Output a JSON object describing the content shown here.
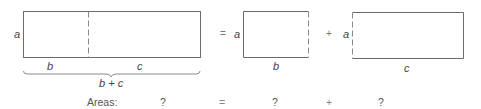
{
  "diagram": {
    "whole": {
      "height_label": "a",
      "width_labels": [
        "b",
        "c"
      ],
      "total_width_label": "b + c"
    },
    "equals_sign": "=",
    "plus_sign": "+",
    "part_b": {
      "height_label": "a",
      "width_label": "b"
    },
    "part_c": {
      "height_label": "a",
      "width_label": "c"
    },
    "areas_row": {
      "label": "Areas:",
      "whole_area": "?",
      "equals": "=",
      "part_b_area": "?",
      "plus": "+",
      "part_c_area": "?"
    },
    "colors": {
      "line": "#6b6b6b",
      "text": "#444444"
    }
  }
}
